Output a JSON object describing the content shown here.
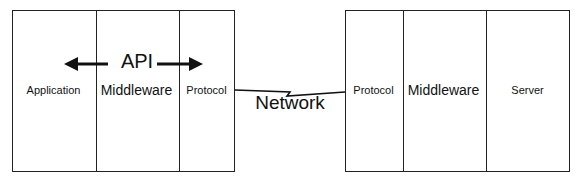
{
  "diagram": {
    "client": {
      "layers": [
        "Application",
        "Middleware",
        "Protocol"
      ]
    },
    "server": {
      "layers": [
        "Protocol",
        "Middleware",
        "Server"
      ]
    },
    "api_label": "API",
    "network_label": "Network"
  }
}
